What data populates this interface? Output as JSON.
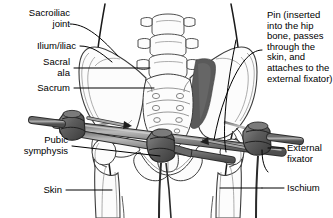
{
  "figure": {
    "kind": "medical-illustration",
    "background_color": "#ffffff",
    "ink_color": "#000000",
    "bone_outline_color": "#3a3a3a",
    "bone_fill_color": "#fbfbfb",
    "hardware_bar_color": "#8e8e8e",
    "hardware_bar_dark": "#4a4a4a",
    "hardware_clamp_color": "#6b6b6b",
    "fracture_shade_color": "#585858"
  },
  "labels": {
    "sacroiliac_joint": "Sacroiliac\njoint",
    "ilium_iliac": "Ilium/iliac",
    "sacral_ala": "Sacral\nala",
    "sacrum": "Sacrum",
    "pubic_symphysis": "Pubic\nsymphysis",
    "skin": "Skin",
    "pin": "Pin (inserted\ninto the hip\nbone, passes\nthrough the\nskin, and\nattaches to\nthe external\nfixator)",
    "external_fixator": "External\nfixator",
    "ischium": "Ischium"
  },
  "anatomy_parts": [
    "lumbar vertebrae",
    "sacrum",
    "sacral ala",
    "sacral foramina",
    "ilium",
    "iliac crest",
    "sacroiliac joint",
    "acetabulum",
    "femoral head",
    "femur",
    "pubic symphysis",
    "ischium",
    "skin outline"
  ],
  "hardware_parts": [
    "external fixator bar",
    "fixator clamp left",
    "fixator clamp center",
    "fixator clamp right",
    "pin left",
    "pin right"
  ]
}
